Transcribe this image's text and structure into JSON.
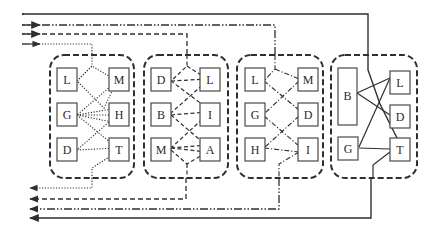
{
  "diagram": {
    "colors": {
      "line": "#2f2f2f",
      "box": "#4a4a4a",
      "text": "#2a2a2a",
      "background": "#ffffff"
    },
    "line_styles": {
      "solid": "",
      "dashdotdot": "8 2 1.5 2 1.5 2",
      "dashed": "5 3",
      "dotted": "1.2 1.6",
      "dashdot": "7 2.5 1.5 2.5"
    },
    "groups": [
      {
        "id": "group-1",
        "link_style": "dotted",
        "nodes": [
          {
            "id": "g1-L",
            "label": "L",
            "col": "left"
          },
          {
            "id": "g1-G",
            "label": "G",
            "col": "left"
          },
          {
            "id": "g1-D",
            "label": "D",
            "col": "left"
          },
          {
            "id": "g1-M",
            "label": "M",
            "col": "right"
          },
          {
            "id": "g1-H",
            "label": "H",
            "col": "right"
          },
          {
            "id": "g1-T",
            "label": "T",
            "col": "right"
          }
        ]
      },
      {
        "id": "group-2",
        "link_style": "dashed",
        "nodes": [
          {
            "id": "g2-D",
            "label": "D",
            "col": "left"
          },
          {
            "id": "g2-B",
            "label": "B",
            "col": "left"
          },
          {
            "id": "g2-M",
            "label": "M",
            "col": "left"
          },
          {
            "id": "g2-L",
            "label": "L",
            "col": "right"
          },
          {
            "id": "g2-I",
            "label": "I",
            "col": "right"
          },
          {
            "id": "g2-A",
            "label": "A",
            "col": "right"
          }
        ]
      },
      {
        "id": "group-3",
        "link_style": "dashdot",
        "nodes": [
          {
            "id": "g3-L",
            "label": "L",
            "col": "left"
          },
          {
            "id": "g3-G",
            "label": "G",
            "col": "left"
          },
          {
            "id": "g3-H",
            "label": "H",
            "col": "left"
          },
          {
            "id": "g3-M",
            "label": "M",
            "col": "right"
          },
          {
            "id": "g3-D",
            "label": "D",
            "col": "right"
          },
          {
            "id": "g3-I",
            "label": "I",
            "col": "right"
          }
        ]
      },
      {
        "id": "group-4",
        "link_style": "solid",
        "nodes": [
          {
            "id": "g4-B",
            "label": "B",
            "col": "left",
            "tall": true
          },
          {
            "id": "g4-G",
            "label": "G",
            "col": "left"
          },
          {
            "id": "g4-L",
            "label": "L",
            "col": "right"
          },
          {
            "id": "g4-D",
            "label": "D",
            "col": "right"
          },
          {
            "id": "g4-T",
            "label": "T",
            "col": "right"
          }
        ]
      }
    ],
    "flows": [
      {
        "id": "flow-solid",
        "style": "solid",
        "enters_group": "group-4"
      },
      {
        "id": "flow-dashdotdot",
        "style": "dashdotdot",
        "enters_group": "group-3"
      },
      {
        "id": "flow-dashed",
        "style": "dashed",
        "enters_group": "group-2"
      },
      {
        "id": "flow-dotted",
        "style": "dotted",
        "enters_group": "group-1"
      }
    ]
  }
}
